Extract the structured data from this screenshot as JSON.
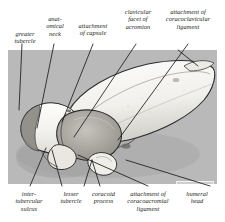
{
  "figure": {
    "panel_background": "#b9b9b9",
    "bone_fill": "#f7f7f5",
    "shadow_fill": "#8c8c8c",
    "outline_color": "#2b2b2b"
  },
  "labels_top": [
    {
      "id": "greater-tubercle",
      "lines": [
        "greater",
        "tubercle"
      ]
    },
    {
      "id": "anatomical-neck",
      "lines": [
        "anat-",
        "omical",
        "neck"
      ]
    },
    {
      "id": "attachment-of-capsule",
      "lines": [
        "attachment",
        "of capsule"
      ]
    },
    {
      "id": "clavicular-facet-of-acromion",
      "lines": [
        "clavicular",
        "facet of",
        "acromion"
      ]
    },
    {
      "id": "attachment-of-coracoclavicular-ligament",
      "lines": [
        "attachment of",
        "coracoclavicular",
        "ligament"
      ]
    }
  ],
  "labels_bottom": [
    {
      "id": "intertubercular-sulcus",
      "lines": [
        "inter-",
        "tubercular",
        "sulcus"
      ]
    },
    {
      "id": "lesser-tubercle",
      "lines": [
        "lesser",
        "tubercle"
      ]
    },
    {
      "id": "coracoid-process",
      "lines": [
        "coracoid",
        "process"
      ]
    },
    {
      "id": "attachment-of-coracoacromial-ligament",
      "lines": [
        "attachment of",
        "coracoacromial",
        "ligament"
      ]
    },
    {
      "id": "humeral-head",
      "lines": [
        "humeral",
        "head"
      ]
    }
  ],
  "compass": {
    "id": "orientation-compass",
    "posterior": "P",
    "anterior": "A",
    "lateral": "la",
    "medial": "m"
  }
}
